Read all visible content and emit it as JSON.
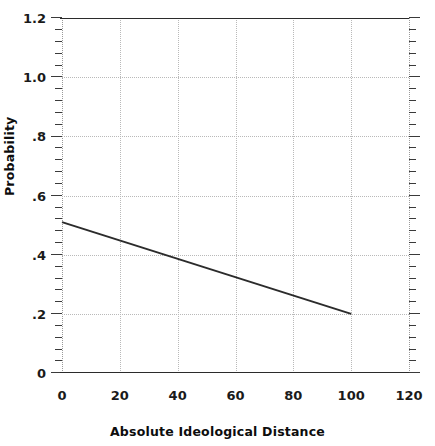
{
  "chart_data": {
    "type": "line",
    "title": "",
    "xlabel": "Absolute Ideological Distance",
    "ylabel": "Probability",
    "xlim": [
      0,
      120
    ],
    "ylim": [
      0,
      1.2
    ],
    "grid": true,
    "legend": null,
    "x_ticks": [
      0,
      20,
      40,
      60,
      80,
      100,
      120
    ],
    "x_tick_labels": [
      "0",
      "20",
      "40",
      "60",
      "80",
      "100",
      "120"
    ],
    "y_ticks": [
      0,
      0.2,
      0.4,
      0.6,
      0.8,
      1.0,
      1.2
    ],
    "y_tick_labels": [
      "0",
      ".2",
      ".4",
      ".6",
      ".8",
      "1.0",
      "1.2"
    ],
    "y_minor_tick_step": 0.04,
    "gridlines_x": [
      20,
      40,
      60,
      80,
      100
    ],
    "gridlines_y": [
      0.2,
      0.4,
      0.6,
      0.8,
      1.0
    ],
    "series": [
      {
        "name": "Predicted probability",
        "color": "#2b2b2b",
        "x": [
          0,
          100
        ],
        "values": [
          0.51,
          0.2
        ]
      }
    ]
  },
  "axis": {
    "x_title": "Absolute Ideological Distance",
    "y_title": "Probability"
  },
  "colors": {
    "line": "#2b2b2b",
    "grid": "#b9b9b9",
    "frame": "#2b2b2b",
    "text": "#111111",
    "background": "#ffffff"
  }
}
